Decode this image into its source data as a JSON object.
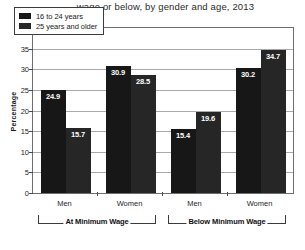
{
  "chart_data": {
    "type": "bar",
    "title": "wage or below, by gender and age, 2013",
    "xlabel": "",
    "ylabel": "Percentage",
    "ylim": [
      0,
      40
    ],
    "ytick_step": 5,
    "yticks": [
      "40",
      "35",
      "30",
      "25",
      "20",
      "15",
      "10",
      "5",
      "0"
    ],
    "grid": true,
    "legend_position": "top-left",
    "categories": [
      "Men",
      "Women",
      "Men",
      "Women"
    ],
    "groups": [
      {
        "label": "At Minimum Wage",
        "categories": [
          "Men",
          "Women"
        ]
      },
      {
        "label": "Below Minimum Wage",
        "categories": [
          "Men",
          "Women"
        ]
      }
    ],
    "series": [
      {
        "name": "16 to 24 years",
        "color": "#171717",
        "values": [
          24.9,
          30.9,
          15.4,
          30.2
        ]
      },
      {
        "name": "25 years and older",
        "color": "#262626",
        "values": [
          15.7,
          28.5,
          19.6,
          34.7
        ]
      }
    ],
    "data_labels": [
      "24.9",
      "15.7",
      "30.9",
      "28.5",
      "15.4",
      "19.6",
      "30.2",
      "34.7"
    ]
  },
  "legend": {
    "items": [
      {
        "label": "16 to 24 years"
      },
      {
        "label": "25 years and older"
      }
    ]
  }
}
